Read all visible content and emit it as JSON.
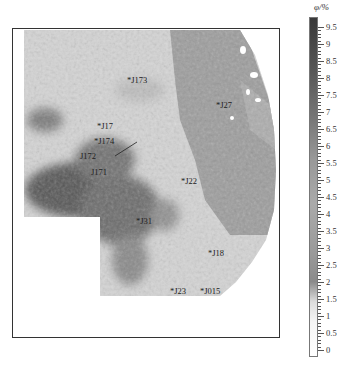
{
  "colorbar": {
    "title": "φ/%",
    "ticks": [
      "9.5",
      "9",
      "8.5",
      "8",
      "7.5",
      "7",
      "6.5",
      "6",
      "5.5",
      "5",
      "4.5",
      "4",
      "3.5",
      "3",
      "2.5",
      "2",
      "1.5",
      "1",
      "0.5",
      "0"
    ],
    "min": 0,
    "max": 9.5
  },
  "wells": [
    {
      "name": "*J173",
      "x": 127,
      "y": 80
    },
    {
      "name": "*J27",
      "x": 216,
      "y": 102
    },
    {
      "name": "*J17",
      "x": 97,
      "y": 124
    },
    {
      "name": "*J174",
      "x": 94,
      "y": 139
    },
    {
      "name": "J172",
      "x": 80,
      "y": 153
    },
    {
      "name": "J171",
      "x": 91,
      "y": 171
    },
    {
      "name": "*J22",
      "x": 181,
      "y": 179
    },
    {
      "name": "*J31",
      "x": 136,
      "y": 217
    },
    {
      "name": "*J18",
      "x": 208,
      "y": 251
    },
    {
      "name": "*J23",
      "x": 170,
      "y": 288
    },
    {
      "name": "*J015",
      "x": 200,
      "y": 288
    }
  ],
  "map": {
    "frame": {
      "x": 12,
      "y": 28,
      "width": 268,
      "height": 310
    },
    "description": "Porosity distribution contour map"
  }
}
